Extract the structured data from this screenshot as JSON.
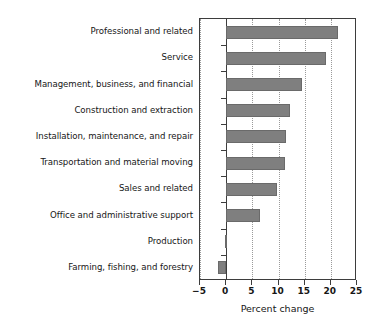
{
  "chart_data": {
    "type": "bar",
    "orientation": "horizontal",
    "title": "",
    "xlabel": "Percent change",
    "ylabel": "",
    "xlim": [
      -5,
      25
    ],
    "xticks": [
      -5,
      0,
      5,
      10,
      15,
      20,
      25
    ],
    "xtick_labels": [
      "−5",
      "0",
      "5",
      "10",
      "15",
      "20",
      "25"
    ],
    "grid": true,
    "grid_axis": "x",
    "legend": null,
    "bar_color": "#7f7f7f",
    "categories": [
      "Professional and related",
      "Service",
      "Management, business, and financial",
      "Construction and extraction",
      "Installation, maintenance, and repair",
      "Transportation and material moving",
      "Sales and related",
      "Office and administrative support",
      "Production",
      "Farming, fishing, and forestry"
    ],
    "values": [
      21.3,
      19.1,
      14.5,
      12.2,
      11.5,
      11.2,
      9.7,
      6.4,
      -0.3,
      -1.5
    ]
  }
}
